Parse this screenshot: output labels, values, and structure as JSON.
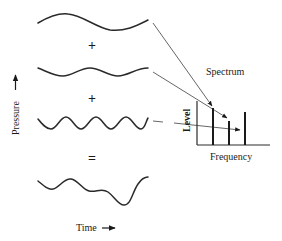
{
  "diagram": {
    "operators": {
      "plus_1": "+",
      "plus_2": "+",
      "equals": "="
    },
    "axes_labels": {
      "pressure": "Pressure",
      "time": "Time",
      "time_arrow": "→",
      "pressure_arrow": "→"
    },
    "spectrum": {
      "title": "Spectrum",
      "y_label": "Level",
      "x_label": "Frequency"
    },
    "waves": [
      {
        "name": "component-1",
        "cycles": 1,
        "amplitude": "large"
      },
      {
        "name": "component-2",
        "cycles": 2,
        "amplitude": "small"
      },
      {
        "name": "component-3",
        "cycles": 4,
        "amplitude": "medium"
      },
      {
        "name": "sum",
        "cycles": "complex"
      }
    ],
    "spectrum_bars": [
      {
        "component": 1,
        "relative_level": 0.85
      },
      {
        "component": 2,
        "relative_level": 0.56
      },
      {
        "component": 3,
        "relative_level": 0.75
      }
    ]
  }
}
